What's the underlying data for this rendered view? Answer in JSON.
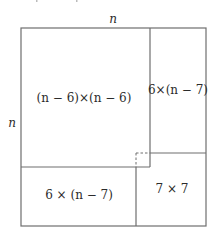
{
  "diagram": {
    "dimension_labels": {
      "top": "n",
      "left": "n"
    },
    "regions": [
      {
        "id": "big-square",
        "label": "(n − 6)×(n − 6)"
      },
      {
        "id": "right-strip",
        "label": "6×(n − 7)"
      },
      {
        "id": "bottom-strip",
        "label": "6 × (n − 7)"
      },
      {
        "id": "corner-square",
        "label": "7 × 7"
      }
    ],
    "overlap_marker": "dashed 1×1 square where regions overlap",
    "colors": {
      "line": "#6e6e6e",
      "text": "#2b2b2b",
      "background": "#ffffff"
    }
  }
}
